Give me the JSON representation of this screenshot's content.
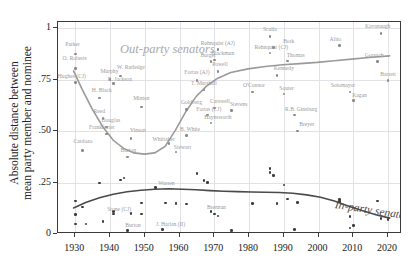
{
  "chart_data": {
    "type": "scatter",
    "title": "",
    "xlabel": "",
    "ylabel": "Absolute distance between mean party member and nominee",
    "ylabel_lines": [
      "Absolute distance between",
      "mean party member and nominee"
    ],
    "xlim": [
      1925,
      2024
    ],
    "ylim": [
      0,
      1.03
    ],
    "grid": true,
    "xticks": [
      1930,
      1940,
      1950,
      1960,
      1970,
      1980,
      1990,
      2000,
      2010,
      2020
    ],
    "xtick_labels": [
      "1930",
      "1940",
      "1950",
      "1960",
      "1970",
      "1980",
      "1990",
      "2000",
      "2010",
      "2020"
    ],
    "yticks": [
      0,
      0.25,
      0.5,
      0.75,
      1
    ],
    "ytick_labels": [
      "0",
      ".25",
      ".50",
      ".75",
      "1"
    ],
    "annotations": [
      {
        "name": "out-party-annotation",
        "text": "Out-party senators",
        "color": "#a9a9a9"
      },
      {
        "name": "in-party-annotation",
        "text": "In-party senators",
        "color": "#4a4a4a"
      }
    ],
    "series": [
      {
        "name": "Out-party senators",
        "color": "#8a8a8a",
        "points": [
          {
            "label": "Parker",
            "x": 1930,
            "y": 0.875,
            "lx": 1929.2,
            "ly": 0.915
          },
          {
            "label": "O. Roberts",
            "x": 1930,
            "y": 0.805,
            "lx": 1929.8,
            "ly": 0.845
          },
          {
            "label": "Hughes (CJ)",
            "x": 1930,
            "y": 0.735,
            "lx": 1929.0,
            "ly": 0.76
          },
          {
            "label": "Cardozo",
            "x": 1932,
            "y": 0.405,
            "lx": 1932.2,
            "ly": 0.44
          },
          {
            "label": "H. Black",
            "x": 1937,
            "y": 0.66,
            "lx": 1937.6,
            "ly": 0.69
          },
          {
            "label": "Reed",
            "x": 1938,
            "y": 0.56,
            "lx": 1936.9,
            "ly": 0.59
          },
          {
            "label": "Frankfurter",
            "x": 1939,
            "y": 0.485,
            "lx": 1937.6,
            "ly": 0.508
          },
          {
            "label": "Douglas",
            "x": 1939,
            "y": 0.52,
            "lx": 1940.2,
            "ly": 0.545
          },
          {
            "label": "Murphy",
            "x": 1940,
            "y": 0.75,
            "lx": 1939.8,
            "ly": 0.782
          },
          {
            "label": "R. Jackson",
            "x": 1941,
            "y": 0.73,
            "lx": 1942.8,
            "ly": 0.745
          },
          {
            "label": "W. Rutledge",
            "x": 1943,
            "y": 0.768,
            "lx": 1946.0,
            "ly": 0.8
          },
          {
            "label": "Burton",
            "x": 1945,
            "y": 0.375,
            "lx": 1945.2,
            "ly": 0.4
          },
          {
            "label": "Vinson",
            "x": 1946,
            "y": 0.465,
            "lx": 1948.0,
            "ly": 0.495
          },
          {
            "label": "Minton",
            "x": 1949,
            "y": 0.618,
            "lx": 1949.0,
            "ly": 0.65
          },
          {
            "label": "Whittaker",
            "x": 1957,
            "y": 0.44,
            "lx": 1955.4,
            "ly": 0.452
          },
          {
            "label": "Stewart",
            "x": 1959,
            "y": 0.398,
            "lx": 1960.8,
            "ly": 0.412
          },
          {
            "label": "B. White",
            "x": 1962,
            "y": 0.478,
            "lx": 1963.0,
            "ly": 0.5
          },
          {
            "label": "Goldberg",
            "x": 1962,
            "y": 0.605,
            "lx": 1963.4,
            "ly": 0.632
          },
          {
            "label": "Fortas (AJ)",
            "x": 1965,
            "y": 0.745,
            "lx": 1965.0,
            "ly": 0.775
          },
          {
            "label": "T. Marshall",
            "x": 1967,
            "y": 0.7,
            "lx": 1967.0,
            "ly": 0.726
          },
          {
            "label": "Fortas (CJ)",
            "x": 1968,
            "y": 0.578,
            "lx": 1968.4,
            "ly": 0.6
          },
          {
            "label": "Haynsworth",
            "x": 1969,
            "y": 0.54,
            "lx": 1971.0,
            "ly": 0.56
          },
          {
            "label": "Carswell",
            "x": 1970,
            "y": 0.612,
            "lx": 1971.6,
            "ly": 0.635
          },
          {
            "label": "Burger",
            "x": 1969,
            "y": 0.838,
            "lx": 1968.2,
            "ly": 0.862
          },
          {
            "label": "Blackmun",
            "x": 1970,
            "y": 0.845,
            "lx": 1972.4,
            "ly": 0.868
          },
          {
            "label": "Powell",
            "x": 1971,
            "y": 0.79,
            "lx": 1971.6,
            "ly": 0.818
          },
          {
            "label": "Rehnquist (AJ)",
            "x": 1971,
            "y": 0.895,
            "lx": 1971.0,
            "ly": 0.918
          },
          {
            "label": "Stevens",
            "x": 1975,
            "y": 0.6,
            "lx": 1977.0,
            "ly": 0.622
          },
          {
            "label": "O'Connor",
            "x": 1981,
            "y": 0.69,
            "lx": 1981.4,
            "ly": 0.712
          },
          {
            "label": "Scalia",
            "x": 1986,
            "y": 0.96,
            "lx": 1986.0,
            "ly": 0.988
          },
          {
            "label": "Rehnquist (CJ)",
            "x": 1986,
            "y": 0.88,
            "lx": 1986.4,
            "ly": 0.9
          },
          {
            "label": "Bork",
            "x": 1987,
            "y": 0.905,
            "lx": 1991.4,
            "ly": 0.93
          },
          {
            "label": "Kennedy",
            "x": 1988,
            "y": 0.77,
            "lx": 1990.0,
            "ly": 0.795
          },
          {
            "label": "Souter",
            "x": 1990,
            "y": 0.68,
            "lx": 1990.8,
            "ly": 0.702
          },
          {
            "label": "Thomas",
            "x": 1991,
            "y": 0.84,
            "lx": 1993.4,
            "ly": 0.862
          },
          {
            "label": "R.B. Ginsburg",
            "x": 1993,
            "y": 0.578,
            "lx": 1995.0,
            "ly": 0.6
          },
          {
            "label": "Breyer",
            "x": 1994,
            "y": 0.5,
            "lx": 1996.6,
            "ly": 0.524
          },
          {
            "label": "Alito",
            "x": 2006,
            "y": 0.915,
            "lx": 2004.8,
            "ly": 0.94
          },
          {
            "label": "Sotomayor",
            "x": 2009,
            "y": 0.69,
            "lx": 2007.0,
            "ly": 0.712
          },
          {
            "label": "Kagan",
            "x": 2010,
            "y": 0.648,
            "lx": 2011.8,
            "ly": 0.668
          },
          {
            "label": "Gorsuch",
            "x": 2017,
            "y": 0.838,
            "lx": 2016.0,
            "ly": 0.862
          },
          {
            "label": "Kavanaugh",
            "x": 2018,
            "y": 0.975,
            "lx": 2017.0,
            "ly": 1.0
          },
          {
            "label": "Barrett",
            "x": 2020,
            "y": 0.745,
            "lx": 2020.0,
            "ly": 0.768
          }
        ]
      },
      {
        "name": "In-party senators",
        "color": "#3d3d3d",
        "points": [
          {
            "label": "",
            "x": 1930,
            "y": 0.16,
            "lx": 0,
            "ly": 0
          },
          {
            "label": "",
            "x": 1930,
            "y": 0.095,
            "lx": 0,
            "ly": 0
          },
          {
            "label": "",
            "x": 1930,
            "y": 0.048,
            "lx": 0,
            "ly": 0
          },
          {
            "label": "",
            "x": 1932,
            "y": 0.132,
            "lx": 0,
            "ly": 0
          },
          {
            "label": "",
            "x": 1933,
            "y": 0.048,
            "lx": 0,
            "ly": 0
          },
          {
            "label": "",
            "x": 1937,
            "y": 0.248,
            "lx": 0,
            "ly": 0
          },
          {
            "label": "",
            "x": 1938,
            "y": 0.06,
            "lx": 0,
            "ly": 0
          },
          {
            "label": "Stone (CJ)",
            "x": 1941,
            "y": 0.098,
            "lx": 1942.6,
            "ly": 0.112
          },
          {
            "label": "",
            "x": 1941,
            "y": 0.108,
            "lx": 0,
            "ly": 0
          },
          {
            "label": "",
            "x": 1943,
            "y": 0.262,
            "lx": 0,
            "ly": 0
          },
          {
            "label": "",
            "x": 1944,
            "y": 0.272,
            "lx": 0,
            "ly": 0
          },
          {
            "label": "Burton",
            "x": 1945,
            "y": 0.018,
            "lx": 1946.6,
            "ly": 0.032
          },
          {
            "label": "",
            "x": 1946,
            "y": 0.1,
            "lx": 0,
            "ly": 0
          },
          {
            "label": "",
            "x": 1949,
            "y": 0.15,
            "lx": 0,
            "ly": 0
          },
          {
            "label": "",
            "x": 1949,
            "y": 0.098,
            "lx": 0,
            "ly": 0
          },
          {
            "label": "J. Harlan (II)",
            "x": 1955,
            "y": 0.022,
            "lx": 1957.4,
            "ly": 0.038
          },
          {
            "label": "Warren",
            "x": 1953,
            "y": 0.225,
            "lx": 1956.2,
            "ly": 0.238
          },
          {
            "label": "Brennan",
            "x": 1956,
            "y": 0.15,
            "lx": 0,
            "ly": 0
          },
          {
            "label": "",
            "x": 1959,
            "y": 0.148,
            "lx": 0,
            "ly": 0
          },
          {
            "label": "",
            "x": 1962,
            "y": 0.145,
            "lx": 0,
            "ly": 0
          },
          {
            "label": "",
            "x": 1965,
            "y": 0.295,
            "lx": 0,
            "ly": 0
          },
          {
            "label": "",
            "x": 1967,
            "y": 0.26,
            "lx": 0,
            "ly": 0
          },
          {
            "label": "",
            "x": 1968,
            "y": 0.25,
            "lx": 0,
            "ly": 0
          },
          {
            "label": "Brennan",
            "x": 1969,
            "y": 0.108,
            "lx": 1970.6,
            "ly": 0.122
          },
          {
            "label": "",
            "x": 1970,
            "y": 0.098,
            "lx": 0,
            "ly": 0
          },
          {
            "label": "",
            "x": 1971,
            "y": 0.088,
            "lx": 0,
            "ly": 0
          },
          {
            "label": "",
            "x": 1975,
            "y": 0.018,
            "lx": 0,
            "ly": 0
          },
          {
            "label": "",
            "x": 1981,
            "y": 0.148,
            "lx": 0,
            "ly": 0
          },
          {
            "label": "",
            "x": 1986,
            "y": 0.318,
            "lx": 0,
            "ly": 0
          },
          {
            "label": "",
            "x": 1986,
            "y": 0.3,
            "lx": 0,
            "ly": 0
          },
          {
            "label": "",
            "x": 1987,
            "y": 0.285,
            "lx": 0,
            "ly": 0
          },
          {
            "label": "",
            "x": 1988,
            "y": 0.148,
            "lx": 0,
            "ly": 0
          },
          {
            "label": "",
            "x": 1990,
            "y": 0.238,
            "lx": 0,
            "ly": 0
          },
          {
            "label": "",
            "x": 1991,
            "y": 0.17,
            "lx": 0,
            "ly": 0
          },
          {
            "label": "",
            "x": 1993,
            "y": 0.022,
            "lx": 0,
            "ly": 0
          },
          {
            "label": "",
            "x": 1994,
            "y": 0.152,
            "lx": 0,
            "ly": 0
          },
          {
            "label": "",
            "x": 2006,
            "y": 0.168,
            "lx": 0,
            "ly": 0
          },
          {
            "label": "",
            "x": 2006,
            "y": 0.158,
            "lx": 0,
            "ly": 0
          },
          {
            "label": "",
            "x": 2009,
            "y": 0.085,
            "lx": 0,
            "ly": 0
          },
          {
            "label": "",
            "x": 2009,
            "y": 0.03,
            "lx": 0,
            "ly": 0
          },
          {
            "label": "",
            "x": 2010,
            "y": 0.042,
            "lx": 0,
            "ly": 0
          },
          {
            "label": "",
            "x": 2017,
            "y": 0.16,
            "lx": 0,
            "ly": 0
          },
          {
            "label": "",
            "x": 2018,
            "y": 0.075,
            "lx": 0,
            "ly": 0
          },
          {
            "label": "",
            "x": 2020,
            "y": 0.07,
            "lx": 0,
            "ly": 0
          }
        ]
      }
    ],
    "trend_lines": [
      {
        "name": "out-party-trend",
        "color": "#9a9a9a",
        "points": [
          [
            1929.5,
            0.79
          ],
          [
            1932,
            0.7
          ],
          [
            1935,
            0.6
          ],
          [
            1938,
            0.515
          ],
          [
            1941,
            0.45
          ],
          [
            1944,
            0.41
          ],
          [
            1947,
            0.388
          ],
          [
            1950,
            0.382
          ],
          [
            1953,
            0.388
          ],
          [
            1956,
            0.42
          ],
          [
            1959,
            0.5
          ],
          [
            1962,
            0.59
          ],
          [
            1965,
            0.665
          ],
          [
            1968,
            0.715
          ],
          [
            1971,
            0.752
          ],
          [
            1975,
            0.782
          ],
          [
            1980,
            0.8
          ],
          [
            1985,
            0.812
          ],
          [
            1990,
            0.82
          ],
          [
            1995,
            0.826
          ],
          [
            2000,
            0.832
          ],
          [
            2005,
            0.84
          ],
          [
            2010,
            0.848
          ],
          [
            2015,
            0.856
          ],
          [
            2021,
            0.864
          ]
        ]
      },
      {
        "name": "in-party-trend",
        "color": "#4a4a4a",
        "points": [
          [
            1929.5,
            0.118
          ],
          [
            1933,
            0.145
          ],
          [
            1937,
            0.168
          ],
          [
            1941,
            0.185
          ],
          [
            1945,
            0.197
          ],
          [
            1949,
            0.205
          ],
          [
            1953,
            0.21
          ],
          [
            1957,
            0.212
          ],
          [
            1961,
            0.21
          ],
          [
            1965,
            0.207
          ],
          [
            1969,
            0.203
          ],
          [
            1973,
            0.2
          ],
          [
            1977,
            0.198
          ],
          [
            1981,
            0.196
          ],
          [
            1985,
            0.195
          ],
          [
            1989,
            0.194
          ],
          [
            1993,
            0.19
          ],
          [
            1997,
            0.182
          ],
          [
            2001,
            0.17
          ],
          [
            2005,
            0.152
          ],
          [
            2009,
            0.128
          ],
          [
            2013,
            0.105
          ],
          [
            2017,
            0.085
          ],
          [
            2021,
            0.068
          ]
        ]
      }
    ]
  }
}
